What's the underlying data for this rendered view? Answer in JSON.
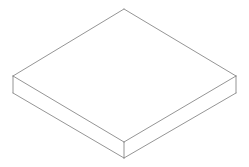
{
  "diagram": {
    "type": "isometric-box",
    "background": "#ffffff",
    "stroke_color": "#7a7a7a",
    "stroke_width": 0.8,
    "vertices": {
      "top_back": [
        124,
        9
      ],
      "top_left": [
        13,
        76
      ],
      "top_right": [
        236,
        76
      ],
      "top_front": [
        124,
        142
      ],
      "bottom_left": [
        13,
        93
      ],
      "bottom_right": [
        236,
        93
      ],
      "bottom_front": [
        124,
        158
      ]
    }
  }
}
